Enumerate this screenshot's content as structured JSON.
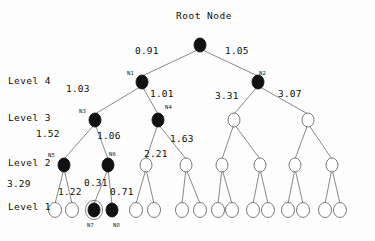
{
  "figure": {
    "title": "Root Node",
    "kind": "hierarchical-tree"
  },
  "level_labels": [
    {
      "text": "Level 4",
      "x": 8,
      "y": 75
    },
    {
      "text": "Level 3",
      "x": 8,
      "y": 112
    },
    {
      "text": "Level 2",
      "x": 8,
      "y": 157
    },
    {
      "text": "Level 1",
      "x": 8,
      "y": 201
    }
  ],
  "edge_weights": [
    {
      "value": "0.91",
      "x": 135,
      "y": 45
    },
    {
      "value": "1.05",
      "x": 225,
      "y": 45
    },
    {
      "value": "1.03",
      "x": 66,
      "y": 83
    },
    {
      "value": "1.01",
      "x": 150,
      "y": 88
    },
    {
      "value": "3.31",
      "x": 215,
      "y": 90
    },
    {
      "value": "3.07",
      "x": 278,
      "y": 88
    },
    {
      "value": "1.52",
      "x": 36,
      "y": 128
    },
    {
      "value": "1.06",
      "x": 97,
      "y": 130
    },
    {
      "value": "1.63",
      "x": 170,
      "y": 133
    },
    {
      "value": "2.21",
      "x": 144,
      "y": 148
    },
    {
      "value": "3.29",
      "x": 7,
      "y": 178
    },
    {
      "value": "1.22",
      "x": 58,
      "y": 186
    },
    {
      "value": "0.31",
      "x": 84,
      "y": 177
    },
    {
      "value": "0.71",
      "x": 110,
      "y": 186
    }
  ],
  "node_tags": [
    {
      "text": "N1",
      "x": 127,
      "y": 70
    },
    {
      "text": "N2",
      "x": 259,
      "y": 70
    },
    {
      "text": "N3",
      "x": 79,
      "y": 108
    },
    {
      "text": "N4",
      "x": 165,
      "y": 104
    },
    {
      "text": "N5",
      "x": 48,
      "y": 152
    },
    {
      "text": "N6",
      "x": 109,
      "y": 151
    },
    {
      "text": "N7",
      "x": 87,
      "y": 222
    },
    {
      "text": "N8",
      "x": 113,
      "y": 222
    }
  ],
  "chart_data": {
    "type": "tree",
    "title": "Root Node",
    "levels": [
      "Level 1",
      "Level 2",
      "Level 3",
      "Level 4"
    ],
    "nodes": [
      {
        "id": "root",
        "x": 200,
        "y": 45,
        "rx": 6.0,
        "ry": 7.0,
        "fill": "filled",
        "ring": false,
        "label": "Root Node",
        "level": 5
      },
      {
        "id": "N1",
        "x": 142,
        "y": 82,
        "rx": 6.0,
        "ry": 7.0,
        "fill": "filled",
        "ring": false,
        "label": "N1",
        "level": 4
      },
      {
        "id": "N2",
        "x": 258,
        "y": 82,
        "rx": 6.0,
        "ry": 7.0,
        "fill": "filled",
        "ring": false,
        "label": "N2",
        "level": 4
      },
      {
        "id": "N3",
        "x": 95,
        "y": 120,
        "rx": 6.0,
        "ry": 7.0,
        "fill": "filled",
        "ring": false,
        "label": "N3",
        "level": 3
      },
      {
        "id": "N4",
        "x": 158,
        "y": 120,
        "rx": 6.0,
        "ry": 7.0,
        "fill": "filled",
        "ring": false,
        "label": "N4",
        "level": 3
      },
      {
        "id": "R3a",
        "x": 234,
        "y": 120,
        "rx": 6.0,
        "ry": 7.0,
        "fill": "open",
        "ring": false,
        "label": "",
        "level": 3
      },
      {
        "id": "R3b",
        "x": 308,
        "y": 120,
        "rx": 6.0,
        "ry": 7.0,
        "fill": "open",
        "ring": false,
        "label": "",
        "level": 3
      },
      {
        "id": "N5",
        "x": 64,
        "y": 165,
        "rx": 6.0,
        "ry": 7.0,
        "fill": "filled",
        "ring": false,
        "label": "N5",
        "level": 2
      },
      {
        "id": "N6",
        "x": 108,
        "y": 165,
        "rx": 6.0,
        "ry": 7.0,
        "fill": "filled",
        "ring": false,
        "label": "N6",
        "level": 2
      },
      {
        "id": "L2c",
        "x": 146,
        "y": 165,
        "rx": 6.0,
        "ry": 7.0,
        "fill": "open",
        "ring": false,
        "label": "",
        "level": 2
      },
      {
        "id": "L2d",
        "x": 186,
        "y": 165,
        "rx": 6.0,
        "ry": 7.0,
        "fill": "open",
        "ring": false,
        "label": "",
        "level": 2
      },
      {
        "id": "L2e",
        "x": 222,
        "y": 165,
        "rx": 6.0,
        "ry": 7.0,
        "fill": "open",
        "ring": false,
        "label": "",
        "level": 2
      },
      {
        "id": "L2f",
        "x": 260,
        "y": 165,
        "rx": 6.0,
        "ry": 7.0,
        "fill": "open",
        "ring": false,
        "label": "",
        "level": 2
      },
      {
        "id": "L2g",
        "x": 295,
        "y": 165,
        "rx": 6.0,
        "ry": 7.0,
        "fill": "open",
        "ring": false,
        "label": "",
        "level": 2
      },
      {
        "id": "L2h",
        "x": 332,
        "y": 165,
        "rx": 6.0,
        "ry": 7.0,
        "fill": "open",
        "ring": false,
        "label": "",
        "level": 2
      },
      {
        "id": "B1",
        "x": 55,
        "y": 210,
        "rx": 6.5,
        "ry": 7.5,
        "fill": "open",
        "ring": false,
        "label": "",
        "level": 1
      },
      {
        "id": "B2",
        "x": 72,
        "y": 210,
        "rx": 6.5,
        "ry": 7.5,
        "fill": "open",
        "ring": false,
        "label": "",
        "level": 1
      },
      {
        "id": "N7",
        "x": 94,
        "y": 210,
        "rx": 6.0,
        "ry": 7.0,
        "fill": "filled",
        "ring": true,
        "label": "N7",
        "level": 1
      },
      {
        "id": "N8",
        "x": 112,
        "y": 210,
        "rx": 6.0,
        "ry": 7.0,
        "fill": "filled",
        "ring": false,
        "label": "N8",
        "level": 1
      },
      {
        "id": "B5",
        "x": 136,
        "y": 210,
        "rx": 6.5,
        "ry": 7.5,
        "fill": "open",
        "ring": false,
        "label": "",
        "level": 1
      },
      {
        "id": "B6",
        "x": 154,
        "y": 210,
        "rx": 6.5,
        "ry": 7.5,
        "fill": "open",
        "ring": false,
        "label": "",
        "level": 1
      },
      {
        "id": "B7",
        "x": 182,
        "y": 210,
        "rx": 6.5,
        "ry": 7.5,
        "fill": "open",
        "ring": false,
        "label": "",
        "level": 1
      },
      {
        "id": "B8",
        "x": 200,
        "y": 210,
        "rx": 6.5,
        "ry": 7.5,
        "fill": "open",
        "ring": false,
        "label": "",
        "level": 1
      },
      {
        "id": "B9",
        "x": 218,
        "y": 210,
        "rx": 6.5,
        "ry": 7.5,
        "fill": "open",
        "ring": false,
        "label": "",
        "level": 1
      },
      {
        "id": "B10",
        "x": 232,
        "y": 210,
        "rx": 6.5,
        "ry": 7.5,
        "fill": "open",
        "ring": false,
        "label": "",
        "level": 1
      },
      {
        "id": "B11",
        "x": 253,
        "y": 210,
        "rx": 6.5,
        "ry": 7.5,
        "fill": "open",
        "ring": false,
        "label": "",
        "level": 1
      },
      {
        "id": "B12",
        "x": 268,
        "y": 210,
        "rx": 6.5,
        "ry": 7.5,
        "fill": "open",
        "ring": false,
        "label": "",
        "level": 1
      },
      {
        "id": "B13",
        "x": 288,
        "y": 210,
        "rx": 6.5,
        "ry": 7.5,
        "fill": "open",
        "ring": false,
        "label": "",
        "level": 1
      },
      {
        "id": "B14",
        "x": 303,
        "y": 210,
        "rx": 6.5,
        "ry": 7.5,
        "fill": "open",
        "ring": false,
        "label": "",
        "level": 1
      },
      {
        "id": "B15",
        "x": 325,
        "y": 210,
        "rx": 6.5,
        "ry": 7.5,
        "fill": "open",
        "ring": false,
        "label": "",
        "level": 1
      },
      {
        "id": "B16",
        "x": 340,
        "y": 210,
        "rx": 6.5,
        "ry": 7.5,
        "fill": "open",
        "ring": false,
        "label": "",
        "level": 1
      }
    ],
    "edges": [
      {
        "from": "root",
        "to": "N1",
        "weight": "0.91"
      },
      {
        "from": "root",
        "to": "N2",
        "weight": "1.05"
      },
      {
        "from": "N1",
        "to": "N3",
        "weight": "1.03"
      },
      {
        "from": "N1",
        "to": "N4",
        "weight": "1.01"
      },
      {
        "from": "N2",
        "to": "R3a",
        "weight": "3.31"
      },
      {
        "from": "N2",
        "to": "R3b",
        "weight": "3.07"
      },
      {
        "from": "N3",
        "to": "N5",
        "weight": "1.52"
      },
      {
        "from": "N3",
        "to": "N6",
        "weight": "1.06"
      },
      {
        "from": "N4",
        "to": "L2c",
        "weight": "2.21"
      },
      {
        "from": "N4",
        "to": "L2d",
        "weight": "1.63"
      },
      {
        "from": "R3a",
        "to": "L2e",
        "weight": ""
      },
      {
        "from": "R3a",
        "to": "L2f",
        "weight": ""
      },
      {
        "from": "R3b",
        "to": "L2g",
        "weight": ""
      },
      {
        "from": "R3b",
        "to": "L2h",
        "weight": ""
      },
      {
        "from": "N5",
        "to": "B1",
        "weight": "3.29"
      },
      {
        "from": "N5",
        "to": "B2",
        "weight": "1.22"
      },
      {
        "from": "N6",
        "to": "N7",
        "weight": "0.31"
      },
      {
        "from": "N6",
        "to": "N8",
        "weight": "0.71"
      },
      {
        "from": "L2c",
        "to": "B5",
        "weight": ""
      },
      {
        "from": "L2c",
        "to": "B6",
        "weight": ""
      },
      {
        "from": "L2d",
        "to": "B7",
        "weight": ""
      },
      {
        "from": "L2d",
        "to": "B8",
        "weight": ""
      },
      {
        "from": "L2e",
        "to": "B9",
        "weight": ""
      },
      {
        "from": "L2e",
        "to": "B10",
        "weight": ""
      },
      {
        "from": "L2f",
        "to": "B11",
        "weight": ""
      },
      {
        "from": "L2f",
        "to": "B12",
        "weight": ""
      },
      {
        "from": "L2g",
        "to": "B13",
        "weight": ""
      },
      {
        "from": "L2g",
        "to": "B14",
        "weight": ""
      },
      {
        "from": "L2h",
        "to": "B15",
        "weight": ""
      },
      {
        "from": "L2h",
        "to": "B16",
        "weight": ""
      }
    ],
    "highlighted_node": "N7",
    "colors": {
      "filled_node": "#111111",
      "open_node": "#ffffff",
      "stroke": "#6a6a6a",
      "text": "#0d0d0d",
      "background": "#fdfdfd"
    }
  },
  "root_title_pos": {
    "x": 176,
    "y": 10
  }
}
